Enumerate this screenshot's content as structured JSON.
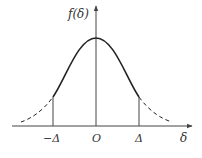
{
  "diagram": {
    "y_axis_label": "f(δ)",
    "x_axis_label": "δ",
    "origin_label": "O",
    "left_bound_label": "−Δ",
    "right_bound_label": "Δ",
    "curve": {
      "type": "gaussian",
      "solid_between": [
        "−Δ",
        "Δ"
      ],
      "dashed_outside": true
    },
    "colors": {
      "line": "#222222",
      "axis": "#444444",
      "text": "#333333"
    }
  }
}
